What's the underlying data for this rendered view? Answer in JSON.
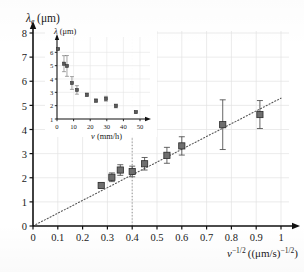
{
  "chart_data": [
    {
      "id": "main",
      "type": "scatter",
      "title": "",
      "xlabel": "v^(-1/2) ((μm/s)^(-1/2))",
      "ylabel": "λ_e (μm)",
      "ylabel_parts": {
        "symbol": "λ",
        "sub": "e",
        "unit": "(μm)"
      },
      "xlabel_parts": {
        "symbol": "v",
        "sup": "−1/2",
        "unit": "((μm/s)",
        "unit_sup": "−1/2",
        "unit_close": ")"
      },
      "xlim": [
        0,
        1
      ],
      "ylim": [
        0,
        8
      ],
      "xticks": [
        "0",
        "0.1",
        "0.2",
        "0.3",
        "0.4",
        "0.5",
        "0.6",
        "0.7",
        "0.8",
        "0.9",
        "1"
      ],
      "xtick_values": [
        0,
        0.1,
        0.2,
        0.3,
        0.4,
        0.5,
        0.6,
        0.7,
        0.8,
        0.9,
        1
      ],
      "yticks": [
        "0",
        "1",
        "2",
        "3",
        "4",
        "5",
        "6",
        "7",
        "8"
      ],
      "ytick_values": [
        0,
        1,
        2,
        3,
        4,
        5,
        6,
        7,
        8
      ],
      "grid": true,
      "grid_color": "#e2e2e2",
      "marker_color": "#6e6e6e",
      "marker_edge_color": "#2a2a2a",
      "fit_line": {
        "style": "dotted",
        "slope": 5.3,
        "intercept": 0.0,
        "x_start": 0.0,
        "x_end": 1.0,
        "color": "#555555"
      },
      "vline": {
        "x": 0.4,
        "style": "dotted",
        "color": "#8a8a8a"
      },
      "points": [
        {
          "x": 0.275,
          "y": 1.68,
          "yerr": 0.1
        },
        {
          "x": 0.318,
          "y": 2.02,
          "yerr": 0.18
        },
        {
          "x": 0.352,
          "y": 2.32,
          "yerr": 0.22
        },
        {
          "x": 0.4,
          "y": 2.26,
          "yerr": 0.22
        },
        {
          "x": 0.45,
          "y": 2.58,
          "yerr": 0.26
        },
        {
          "x": 0.54,
          "y": 2.93,
          "yerr": 0.33
        },
        {
          "x": 0.6,
          "y": 3.32,
          "yerr": 0.38
        },
        {
          "x": 0.765,
          "y": 4.2,
          "yerr": 1.03
        },
        {
          "x": 0.915,
          "y": 4.62,
          "yerr": 0.58
        }
      ]
    },
    {
      "id": "inset",
      "type": "scatter",
      "title": "",
      "xlabel": "v (mm/h)",
      "ylabel": "λ (μm)",
      "xlim": [
        0,
        50
      ],
      "ylim": [
        1,
        6.4
      ],
      "xticks": [
        "0",
        "10",
        "20",
        "30",
        "40",
        "50"
      ],
      "xtick_values": [
        0,
        10,
        20,
        30,
        40,
        50
      ],
      "yticks": [
        "1",
        "2",
        "3",
        "4",
        "5",
        "6"
      ],
      "ytick_values": [
        1,
        2,
        3,
        4,
        5,
        6
      ],
      "grid": true,
      "grid_color": "#e6e6e6",
      "marker_color": "#5a5a5a",
      "points": [
        {
          "x": 0.6,
          "y": 6.25,
          "yerr": 0.05
        },
        {
          "x": 4.2,
          "y": 5.15,
          "yerr": 0.6
        },
        {
          "x": 6.0,
          "y": 4.98,
          "yerr": 0.78
        },
        {
          "x": 9.0,
          "y": 3.7,
          "yerr": 0.48
        },
        {
          "x": 12.0,
          "y": 3.18,
          "yerr": 0.32
        },
        {
          "x": 18.0,
          "y": 2.82,
          "yerr": 0.12
        },
        {
          "x": 23.5,
          "y": 2.38,
          "yerr": 0.12
        },
        {
          "x": 29.5,
          "y": 2.52,
          "yerr": 0.18
        },
        {
          "x": 35.5,
          "y": 1.98,
          "yerr": 0.14
        },
        {
          "x": 47.5,
          "y": 1.52,
          "yerr": 0.08
        }
      ]
    }
  ]
}
